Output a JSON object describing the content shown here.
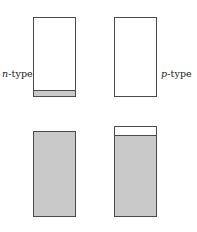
{
  "figure": {
    "title": "",
    "background_color": "#ffffff",
    "outline_color": "#4a4a4a",
    "fill_color": "#c9c9c9",
    "empty_color": "#ffffff"
  },
  "labels": {
    "n_type": {
      "symbol": "n",
      "suffix": "-type",
      "full": "n-type"
    },
    "p_type": {
      "symbol": "p",
      "suffix": "-type",
      "full": "p-type"
    }
  },
  "chart_data": {
    "type": "diagram",
    "title": "",
    "columns": [
      "n-type",
      "p-type"
    ],
    "rows": [
      "top",
      "bottom"
    ],
    "blocks": [
      {
        "id": "n-top",
        "column": "n-type",
        "row": "top",
        "x": 33,
        "y": 17,
        "width": 43,
        "height": 80,
        "body_fill": "#ffffff",
        "band": {
          "position": "bottom",
          "height_px": 6,
          "color": "#c9c9c9"
        },
        "fill_fraction": 0.075
      },
      {
        "id": "p-top",
        "column": "p-type",
        "row": "top",
        "x": 114,
        "y": 17,
        "width": 43,
        "height": 80,
        "body_fill": "#ffffff",
        "band": null,
        "fill_fraction": 0.0
      },
      {
        "id": "n-bottom",
        "column": "n-type",
        "row": "bottom",
        "x": 33,
        "y": 131,
        "width": 43,
        "height": 86,
        "body_fill": "#c9c9c9",
        "band": null,
        "fill_fraction": 1.0
      },
      {
        "id": "p-bottom",
        "column": "p-type",
        "row": "bottom",
        "x": 114,
        "y": 126,
        "width": 43,
        "height": 91,
        "body_fill": "#c9c9c9",
        "band": {
          "position": "top",
          "height_px": 9,
          "color": "#ffffff"
        },
        "fill_fraction": 0.9
      }
    ],
    "annotations": [
      {
        "text": "n-type",
        "x": 2,
        "y": 68,
        "anchor": "left-of-block",
        "target": "n-top"
      },
      {
        "text": "p-type",
        "x": 161,
        "y": 68,
        "anchor": "right-of-block",
        "target": "p-top"
      }
    ]
  }
}
